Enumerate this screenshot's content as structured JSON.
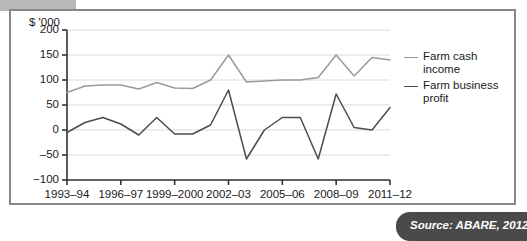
{
  "figure": {
    "source_note": "Source: ABARE, 2012"
  },
  "chart_data": {
    "type": "line",
    "title": "",
    "xlabel": "",
    "ylabel": "$ '000",
    "ylim": [
      -100,
      200
    ],
    "yticks": [
      200,
      150,
      100,
      50,
      0,
      -50,
      -100
    ],
    "ytick_labels": [
      "200",
      "150",
      "100",
      "50",
      "0",
      "‒50",
      "−100"
    ],
    "grid": true,
    "legend_position": "right",
    "x": [
      "1993–94",
      "1994–95",
      "1995–96",
      "1996–97",
      "1997–98",
      "1998–99",
      "1999–2000",
      "2000–01",
      "2001–02",
      "2002–03",
      "2003–04",
      "2004–05",
      "2005–06",
      "2006–07",
      "2007–08",
      "2008–09",
      "2009–10",
      "2010–11",
      "2011–12"
    ],
    "xtick_labels": [
      "1993–94",
      "1996–97",
      "1999–2000",
      "2002–03",
      "2005–06",
      "2008–09",
      "2011–12"
    ],
    "xtick_indices": [
      0,
      3,
      6,
      9,
      12,
      15,
      18
    ],
    "series": [
      {
        "name": "Farm cash income",
        "color": "#9a9a9a",
        "values": [
          75,
          88,
          90,
          90,
          82,
          95,
          84,
          83,
          100,
          150,
          96,
          98,
          100,
          100,
          105,
          150,
          108,
          145,
          140
        ]
      },
      {
        "name": "Farm business profit",
        "color": "#4c4c4c",
        "values": [
          -5,
          15,
          25,
          12,
          -10,
          25,
          -8,
          -8,
          10,
          80,
          -58,
          0,
          25,
          25,
          -58,
          72,
          5,
          0,
          45
        ]
      }
    ]
  },
  "legend": {
    "items": [
      {
        "label": "Farm cash income"
      },
      {
        "label": "Farm business profit"
      }
    ]
  }
}
